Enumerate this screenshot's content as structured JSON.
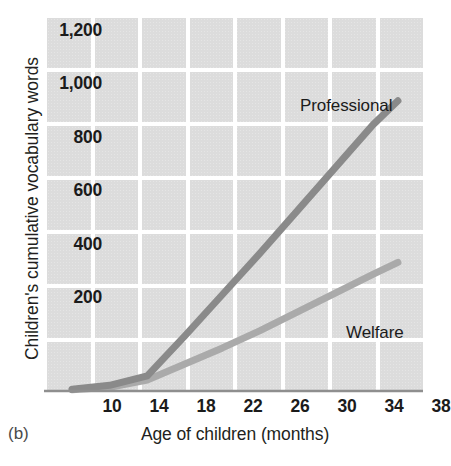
{
  "panel": {
    "label": "(b)"
  },
  "axes": {
    "y_title": "Children's cumulative vocabulary words",
    "x_title": "Age of children (months)",
    "y_ticks": [
      "200",
      "400",
      "600",
      "800",
      "1,000",
      "1,200"
    ],
    "x_ticks": [
      "10",
      "14",
      "18",
      "22",
      "26",
      "30",
      "34",
      "38"
    ]
  },
  "series_labels": {
    "professional": "Professional",
    "welfare": "Welfare"
  },
  "colors": {
    "grid_cell": "#dcdcdc",
    "page_background": "#ffffff",
    "axis_line": "#8f8f8f",
    "professional_line": "#8a8a8a",
    "welfare_line": "#aaaaaa",
    "text": "#231f20"
  },
  "chart_data": {
    "type": "line",
    "title": "",
    "subtitle": "",
    "xlabel": "Age of children (months)",
    "ylabel": "Children's cumulative vocabulary words",
    "xlim": [
      8,
      38
    ],
    "ylim": [
      0,
      1400
    ],
    "x_ticks": [
      10,
      14,
      18,
      22,
      26,
      30,
      34,
      38
    ],
    "y_ticks": [
      200,
      400,
      600,
      800,
      1000,
      1200
    ],
    "grid": true,
    "legend": "inline-annotations",
    "annotations": [
      {
        "text": "Professional",
        "x": 28,
        "y": 1060
      },
      {
        "text": "Welfare",
        "x": 31,
        "y": 230
      }
    ],
    "series": [
      {
        "name": "Professional",
        "color": "#8a8a8a",
        "x": [
          10,
          13,
          16,
          19,
          22,
          25,
          28,
          31,
          34,
          36
        ],
        "values": [
          10,
          25,
          60,
          210,
          365,
          520,
          680,
          840,
          1000,
          1090
        ]
      },
      {
        "name": "Welfare",
        "color": "#aaaaaa",
        "x": [
          10,
          13,
          16,
          19,
          22,
          25,
          28,
          31,
          34,
          36
        ],
        "values": [
          8,
          18,
          45,
          105,
          165,
          230,
          300,
          370,
          440,
          485
        ]
      }
    ]
  }
}
